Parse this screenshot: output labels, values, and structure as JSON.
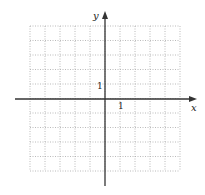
{
  "diagram": {
    "type": "coordinate-grid",
    "x_axis_label": "x",
    "y_axis_label": "y",
    "x_tick_label": "1",
    "y_tick_label": "1",
    "x_range": [
      -5,
      5
    ],
    "y_range": [
      -5,
      5
    ],
    "grid_step": 1,
    "grid_style": "dotted",
    "colors": {
      "axis": "#333333",
      "grid": "#a8a8a8",
      "text": "#222222"
    }
  }
}
